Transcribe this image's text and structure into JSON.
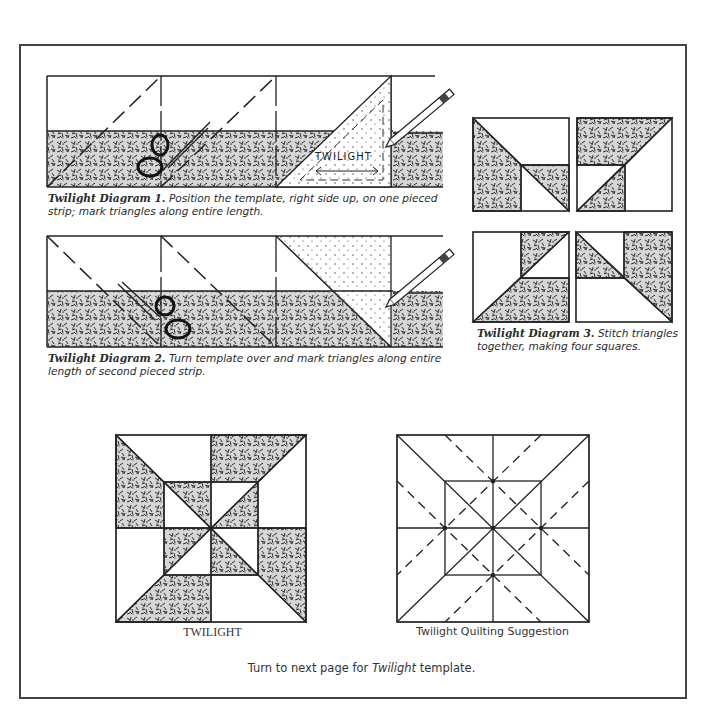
{
  "diagram1": {
    "title": "Twilight Diagram 1.",
    "text": "Position the template, right side up, on one pieced strip; mark triangles along entire length.",
    "template_label": "TWILIGHT"
  },
  "diagram2": {
    "title": "Twilight Diagram 2.",
    "text": "Turn template over and mark triangles along entire length of second pieced strip."
  },
  "diagram3": {
    "title": "Twilight Diagram 3.",
    "text": "Stitch triangles together, making four squares."
  },
  "block": {
    "label": "TWILIGHT"
  },
  "quilting": {
    "label": "Twilight Quilting Suggestion"
  },
  "footer": {
    "prefix": "Turn to next page for",
    "emphasis": "Twilight",
    "suffix": "template."
  },
  "colors": {
    "ink": "#222222",
    "frame": "#444444",
    "paper": "#ffffff"
  }
}
